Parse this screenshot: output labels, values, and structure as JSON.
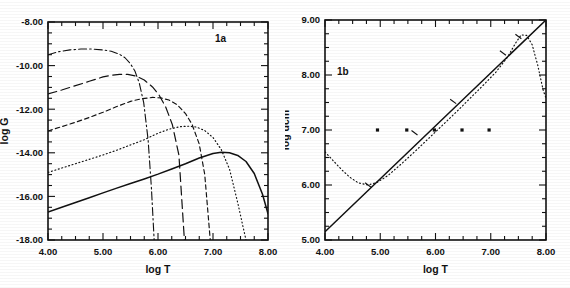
{
  "figure": {
    "kind": "two-panel-scientific-figure",
    "background": "#ffffff",
    "ink": "#111111"
  },
  "chart_data": [
    {
      "id": "panel-1a",
      "type": "line",
      "title": "1a",
      "panel_label": "1a",
      "xlabel": "log T",
      "ylabel": "log G",
      "xlim": [
        4.0,
        8.0
      ],
      "ylim": [
        -18.0,
        -8.0
      ],
      "xticks": [
        4.0,
        5.0,
        6.0,
        7.0,
        8.0
      ],
      "xticklabels": [
        "4.00",
        "5.00",
        "6.00",
        "7.00",
        "8.00"
      ],
      "yticks": [
        -18.0,
        -16.0,
        -14.0,
        -12.0,
        -10.0,
        -8.0
      ],
      "yticklabels": [
        "-18.00",
        "-16.00",
        "-14.00",
        "-12.00",
        "-10.00",
        "-8.00"
      ],
      "minor_tick_step_x": 0.25,
      "minor_tick_step_y": 0.5,
      "grid": false,
      "legend": "none",
      "series": [
        {
          "name": "curve-solid",
          "style": "solid",
          "x": [
            4.0,
            4.25,
            4.5,
            4.75,
            5.0,
            5.25,
            5.5,
            5.75,
            6.0,
            6.25,
            6.5,
            6.75,
            7.0,
            7.15,
            7.3,
            7.45,
            7.6,
            7.75,
            7.9,
            8.0
          ],
          "y": [
            -16.72,
            -16.5,
            -16.28,
            -16.06,
            -15.84,
            -15.62,
            -15.41,
            -15.2,
            -14.98,
            -14.74,
            -14.5,
            -14.24,
            -14.03,
            -13.98,
            -14.0,
            -14.12,
            -14.4,
            -14.95,
            -15.9,
            -16.8
          ]
        },
        {
          "name": "curve-dotted",
          "style": "dotted",
          "x": [
            4.0,
            4.25,
            4.5,
            4.75,
            5.0,
            5.25,
            5.5,
            5.75,
            6.0,
            6.2,
            6.4,
            6.55,
            6.7,
            6.85,
            7.0,
            7.15,
            7.3,
            7.45,
            7.6
          ],
          "y": [
            -14.9,
            -14.7,
            -14.5,
            -14.3,
            -14.1,
            -13.88,
            -13.64,
            -13.4,
            -13.1,
            -12.92,
            -12.8,
            -12.78,
            -12.82,
            -12.98,
            -13.3,
            -13.85,
            -14.75,
            -16.3,
            -18.0
          ]
        },
        {
          "name": "curve-dashed-short",
          "style": "dashed-short",
          "x": [
            4.0,
            4.25,
            4.5,
            4.75,
            5.0,
            5.25,
            5.5,
            5.7,
            5.9,
            6.05,
            6.2,
            6.35,
            6.5,
            6.62,
            6.75,
            6.85,
            6.95
          ],
          "y": [
            -13.0,
            -12.8,
            -12.6,
            -12.38,
            -12.14,
            -11.88,
            -11.64,
            -11.52,
            -11.46,
            -11.48,
            -11.58,
            -11.8,
            -12.2,
            -12.7,
            -13.6,
            -15.0,
            -18.0
          ]
        },
        {
          "name": "curve-dashed-long",
          "style": "dashed-long",
          "x": [
            4.0,
            4.25,
            4.5,
            4.75,
            5.0,
            5.15,
            5.3,
            5.45,
            5.6,
            5.75,
            5.9,
            6.02,
            6.14,
            6.26,
            6.38,
            6.48
          ],
          "y": [
            -11.3,
            -11.12,
            -10.92,
            -10.72,
            -10.52,
            -10.44,
            -10.4,
            -10.4,
            -10.48,
            -10.66,
            -10.98,
            -11.35,
            -11.9,
            -12.7,
            -14.1,
            -18.0
          ]
        },
        {
          "name": "curve-dash-dot",
          "style": "dash-dot",
          "x": [
            4.0,
            4.2,
            4.4,
            4.6,
            4.8,
            5.0,
            5.15,
            5.3,
            5.4,
            5.5,
            5.58,
            5.66,
            5.74,
            5.82,
            5.88,
            5.93
          ],
          "y": [
            -9.5,
            -9.36,
            -9.28,
            -9.24,
            -9.24,
            -9.28,
            -9.34,
            -9.48,
            -9.64,
            -9.92,
            -10.25,
            -10.8,
            -11.7,
            -13.4,
            -15.6,
            -18.0
          ]
        }
      ]
    },
    {
      "id": "panel-1b",
      "type": "line",
      "title": "1b",
      "panel_label": "1b",
      "xlabel": "log T",
      "ylabel": "log dcm",
      "xlim": [
        4.0,
        8.0
      ],
      "ylim": [
        5.0,
        9.0
      ],
      "xticks": [
        4.0,
        5.0,
        6.0,
        7.0,
        8.0
      ],
      "xticklabels": [
        "4.00",
        "5.00",
        "6.00",
        "7.00",
        "8.00"
      ],
      "yticks": [
        5.0,
        6.0,
        7.0,
        8.0,
        9.0
      ],
      "yticklabels": [
        "5.00",
        "6.00",
        "7.00",
        "8.00",
        "9.00"
      ],
      "minor_tick_step_x": 0.25,
      "minor_tick_step_y": 0.25,
      "grid": false,
      "legend": "none",
      "series": [
        {
          "name": "line-solid-diagonal",
          "style": "solid",
          "x": [
            4.0,
            8.0
          ],
          "y": [
            5.15,
            9.0
          ]
        },
        {
          "name": "curve-dotted",
          "style": "dotted",
          "x": [
            4.0,
            4.15,
            4.3,
            4.45,
            4.6,
            4.78,
            4.95,
            5.15,
            5.4,
            5.65,
            5.9,
            6.15,
            6.4,
            6.65,
            6.9,
            7.1,
            7.3,
            7.45,
            7.55,
            7.65,
            7.75,
            7.85,
            7.95,
            8.0
          ],
          "y": [
            6.6,
            6.44,
            6.28,
            6.14,
            6.04,
            6.0,
            6.05,
            6.18,
            6.4,
            6.63,
            6.87,
            7.11,
            7.35,
            7.6,
            7.85,
            8.06,
            8.32,
            8.58,
            8.73,
            8.72,
            8.55,
            8.18,
            7.72,
            7.58
          ]
        }
      ],
      "markers": {
        "name": "dot-markers",
        "shape": "square-dot",
        "x": [
          4.95,
          5.48,
          5.98,
          6.48,
          6.97
        ],
        "y": [
          7.0,
          7.0,
          7.0,
          7.0,
          7.0
        ]
      },
      "tick_markers_on_solid": {
        "name": "cross-tick-markers",
        "x": [
          4.78,
          5.62,
          6.32,
          7.22,
          7.5
        ],
        "y": [
          6.0,
          6.95,
          7.52,
          8.4,
          8.7
        ]
      }
    }
  ]
}
